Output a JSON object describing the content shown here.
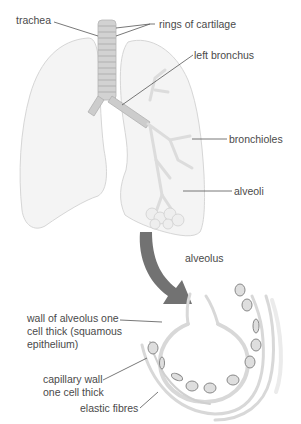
{
  "diagram": {
    "labels": {
      "trachea": "trachea",
      "rings_of_cartilage": "rings of cartilage",
      "left_bronchus": "left bronchus",
      "bronchioles": "bronchioles",
      "alveoli": "alveoli",
      "alveolus": "alveolus",
      "wall_line1": "wall of alveolus one",
      "wall_line2": "cell thick (squamous",
      "wall_line3": "epithelium)",
      "capillary_line1": "capillary wall",
      "capillary_line2": "one cell thick",
      "elastic_fibres": "elastic fibres"
    },
    "colors": {
      "lung_fill": "#f3f3f3",
      "lung_stroke": "#d4d4d4",
      "trachea": "#c8c8c8",
      "arrow": "#6e6e6e",
      "leader_line": "#555555",
      "text": "#4a4a4a"
    }
  }
}
